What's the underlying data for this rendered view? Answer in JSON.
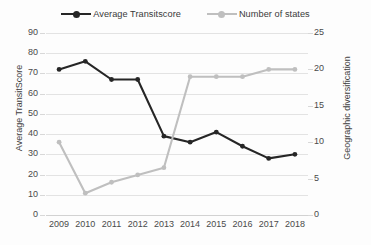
{
  "chart_data": {
    "type": "line",
    "title": "",
    "xlabel": "",
    "ylabel": "Average TransitScore",
    "y2label": "Geographic diversification",
    "categories": [
      "2009",
      "2010",
      "2011",
      "2012",
      "2013",
      "2014",
      "2015",
      "2016",
      "2017",
      "2018"
    ],
    "ylim": [
      0,
      90
    ],
    "y2lim": [
      0,
      25
    ],
    "yticks": [
      0,
      10,
      20,
      30,
      40,
      50,
      60,
      70,
      80,
      90
    ],
    "y2ticks": [
      0,
      5,
      10,
      15,
      20,
      25
    ],
    "grid": true,
    "legend_position": "top-center",
    "series": [
      {
        "name": "Average Transitscore",
        "axis": "left",
        "color": "#262626",
        "marker": "circle",
        "values": [
          72,
          76,
          67,
          67,
          39,
          36,
          41,
          34,
          28,
          30
        ]
      },
      {
        "name": "Number of states",
        "axis": "right",
        "color": "#bfbfbf",
        "marker": "circle",
        "values": [
          10,
          3,
          4.5,
          5.5,
          6.5,
          19,
          19,
          19,
          20,
          20
        ]
      }
    ]
  },
  "legend": {
    "items": [
      {
        "label": "Average Transitscore",
        "color": "#262626"
      },
      {
        "label": "Number of states",
        "color": "#bfbfbf"
      }
    ]
  },
  "axes": {
    "left_title": "Average TransitScore",
    "right_title": "Geographic diversification"
  }
}
